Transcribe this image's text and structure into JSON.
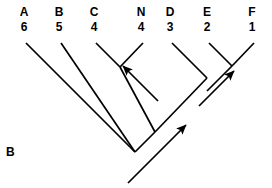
{
  "figure": {
    "panel_label": "B",
    "type": "cladogram",
    "background_color": "#ffffff",
    "line_color": "#000000"
  },
  "tips": [
    {
      "name": "A",
      "number": "6",
      "x": 26,
      "label_x": 14
    },
    {
      "name": "B",
      "number": "5",
      "x": 61,
      "label_x": 49
    },
    {
      "name": "C",
      "number": "4",
      "x": 96,
      "label_x": 84
    },
    {
      "name": "N",
      "number": "4",
      "x": 143,
      "label_x": 131
    },
    {
      "name": "D",
      "number": "3",
      "x": 172,
      "label_x": 160
    },
    {
      "name": "E",
      "number": "2",
      "x": 209,
      "label_x": 197
    },
    {
      "name": "F",
      "number": "1",
      "x": 254,
      "label_x": 242
    }
  ],
  "tree_geometry": {
    "tip_y": 43,
    "branches": [
      {
        "name": "tip-branch-A",
        "x1": 26,
        "y1": 43,
        "x2": 135,
        "y2": 152
      },
      {
        "name": "tip-branch-B",
        "x1": 61,
        "y1": 43,
        "x2": 135,
        "y2": 152
      },
      {
        "name": "tip-branch-C",
        "x1": 96,
        "y1": 43,
        "x2": 120,
        "y2": 67
      },
      {
        "name": "tip-branch-N",
        "x1": 143,
        "y1": 43,
        "x2": 120,
        "y2": 67
      },
      {
        "name": "clade-CN-stem",
        "x1": 120,
        "y1": 67,
        "x2": 155,
        "y2": 132
      },
      {
        "name": "tip-branch-D",
        "x1": 172,
        "y1": 43,
        "x2": 207,
        "y2": 78
      },
      {
        "name": "tip-branch-E",
        "x1": 209,
        "y1": 43,
        "x2": 232,
        "y2": 66
      },
      {
        "name": "tip-branch-F",
        "x1": 254,
        "y1": 43,
        "x2": 232,
        "y2": 66
      },
      {
        "name": "clade-EF-stem",
        "x1": 232,
        "y1": 66,
        "x2": 207,
        "y2": 91
      },
      {
        "name": "clade-DEF-stem",
        "x1": 207,
        "y1": 78,
        "x2": 155,
        "y2": 132
      },
      {
        "name": "clade-CN-to-root",
        "x1": 155,
        "y1": 132,
        "x2": 135,
        "y2": 152
      }
    ],
    "arrows": [
      {
        "name": "arrow-to-node-CN",
        "x1": 158,
        "y1": 101,
        "x2": 123,
        "y2": 66
      },
      {
        "name": "arrow-to-node-EF",
        "x1": 199,
        "y1": 106,
        "x2": 234,
        "y2": 71
      },
      {
        "name": "arrow-to-node-root",
        "x1": 128,
        "y1": 183,
        "x2": 186,
        "y2": 125
      }
    ]
  }
}
